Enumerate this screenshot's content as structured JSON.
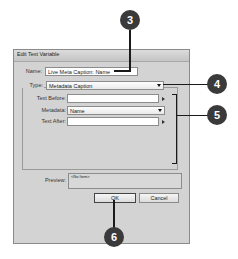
{
  "dialog": {
    "title": "Edit Text Variable",
    "name_label": "Name:",
    "name_value": "Live Meta Caption: Name",
    "type_label": "Type:",
    "type_value": "Metadata Caption",
    "text_before_label": "Text Before:",
    "text_before_value": "",
    "metadata_label": "Metadata:",
    "metadata_value": "Name",
    "text_after_label": "Text After:",
    "text_after_value": "",
    "preview_label": "Preview:",
    "preview_value": "<No Item>",
    "ok_label": "OK",
    "cancel_label": "Cancel"
  },
  "callouts": [
    {
      "number": "3"
    },
    {
      "number": "4"
    },
    {
      "number": "5"
    },
    {
      "number": "6"
    }
  ],
  "colors": {
    "callout_bg": "#3a3a3a",
    "dialog_bg": "#d3d3d3"
  }
}
